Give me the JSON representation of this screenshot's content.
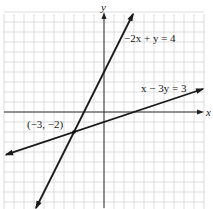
{
  "chart_data": {
    "type": "line",
    "title": "",
    "xlabel": "x",
    "ylabel": "y",
    "xlim": [
      -10,
      10
    ],
    "ylim": [
      -10,
      10
    ],
    "grid": true,
    "grid_step": 1,
    "series": [
      {
        "name": "-2x + y = 4",
        "equation": "y = 2x + 4",
        "label": "−2x + y = 4",
        "x": [
          -6.8,
          2.9
        ],
        "y": [
          -9.6,
          9.8
        ]
      },
      {
        "name": "x - 3y = 3",
        "equation": "y = (x - 3) / 3",
        "label": "x − 3y = 3",
        "x": [
          -9.8,
          9.9
        ],
        "y": [
          -4.27,
          2.3
        ]
      }
    ],
    "annotations": [
      {
        "text": "(−3, −2)",
        "x": -3,
        "y": -2,
        "type": "intersection-point"
      }
    ]
  },
  "labels": {
    "x_axis": "x",
    "y_axis": "y",
    "line1": "−2x + y = 4",
    "line2": "x − 3y = 3",
    "point": "(−3, −2)"
  }
}
